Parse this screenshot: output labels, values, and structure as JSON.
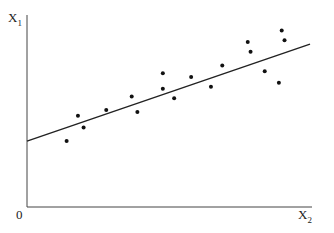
{
  "chart_data": {
    "type": "scatter",
    "title": "",
    "xlabel": "X2",
    "ylabel": "X1",
    "origin_label": "0",
    "grid": false,
    "legend": null,
    "xlim": [
      0,
      100
    ],
    "ylim": [
      0,
      100
    ],
    "points": [
      {
        "x": 14,
        "y": 34
      },
      {
        "x": 18,
        "y": 47
      },
      {
        "x": 20,
        "y": 41
      },
      {
        "x": 28,
        "y": 50
      },
      {
        "x": 37,
        "y": 57
      },
      {
        "x": 39,
        "y": 49
      },
      {
        "x": 48,
        "y": 61
      },
      {
        "x": 48,
        "y": 69
      },
      {
        "x": 52,
        "y": 56
      },
      {
        "x": 58,
        "y": 67
      },
      {
        "x": 65,
        "y": 62
      },
      {
        "x": 69,
        "y": 73
      },
      {
        "x": 78,
        "y": 85
      },
      {
        "x": 79,
        "y": 80
      },
      {
        "x": 84,
        "y": 70
      },
      {
        "x": 89,
        "y": 64
      },
      {
        "x": 90,
        "y": 91
      },
      {
        "x": 91,
        "y": 86
      }
    ],
    "regression_line": {
      "x0": 0,
      "y0": 34,
      "x1": 100,
      "y1": 84
    }
  },
  "labels": {
    "y_axis": "X",
    "y_axis_sub": "1",
    "x_axis": "X",
    "x_axis_sub": "2",
    "origin": "0"
  }
}
